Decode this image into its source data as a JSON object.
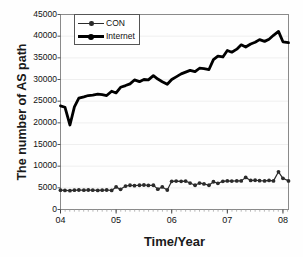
{
  "chart_data": {
    "type": "line",
    "title": "",
    "xlabel": "Time/Year",
    "ylabel": "The number of AS path",
    "ylim": [
      0,
      45000
    ],
    "ytick_labels": [
      "45000",
      "40000",
      "35000",
      "30000",
      "25000",
      "20000",
      "15000",
      "10000",
      "5000",
      "0"
    ],
    "ytick_values": [
      45000,
      40000,
      35000,
      30000,
      25000,
      20000,
      15000,
      10000,
      5000,
      0
    ],
    "xlim": [
      2004.0,
      2008.1
    ],
    "xtick_labels": [
      "04",
      "05",
      "06",
      "07",
      "08"
    ],
    "xtick_values": [
      2004,
      2005,
      2006,
      2007,
      2008
    ],
    "grid": "horizontal-faint",
    "legend_position": "top-left-inside",
    "minor_x_ticks": "monthly",
    "x": [
      2004.0,
      2004.08,
      2004.17,
      2004.25,
      2004.33,
      2004.42,
      2004.5,
      2004.58,
      2004.67,
      2004.75,
      2004.83,
      2004.92,
      2005.0,
      2005.08,
      2005.17,
      2005.25,
      2005.33,
      2005.42,
      2005.5,
      2005.58,
      2005.67,
      2005.75,
      2005.83,
      2005.92,
      2006.0,
      2006.08,
      2006.17,
      2006.25,
      2006.33,
      2006.42,
      2006.5,
      2006.58,
      2006.67,
      2006.75,
      2006.83,
      2006.92,
      2007.0,
      2007.08,
      2007.17,
      2007.25,
      2007.33,
      2007.42,
      2007.5,
      2007.58,
      2007.67,
      2007.75,
      2007.83,
      2007.92,
      2008.0,
      2008.1
    ],
    "series": [
      {
        "name": "Internet",
        "style": "thick-solid-black",
        "color": "#000000",
        "values": [
          23900,
          23600,
          19500,
          23700,
          25700,
          26000,
          26300,
          26400,
          26600,
          26500,
          26300,
          27300,
          26900,
          28200,
          28600,
          29000,
          29900,
          29500,
          30000,
          29900,
          30900,
          30100,
          29500,
          28900,
          30000,
          30600,
          31300,
          31700,
          32100,
          31800,
          32600,
          32500,
          32300,
          34600,
          35400,
          35200,
          36700,
          36300,
          37000,
          38000,
          37500,
          38200,
          38600,
          39200,
          38800,
          39300,
          40200,
          41100,
          38700,
          38500
        ]
      },
      {
        "name": "CON",
        "style": "thin-solid-with-round-markers",
        "color": "#2b2b2b",
        "values": [
          4450,
          4400,
          4350,
          4450,
          4500,
          4450,
          4500,
          4450,
          4400,
          4450,
          4500,
          4400,
          5200,
          4650,
          5400,
          5600,
          5500,
          5600,
          5650,
          5550,
          5600,
          4700,
          5200,
          4500,
          6500,
          6550,
          6500,
          6550,
          6100,
          5600,
          6100,
          5900,
          5600,
          6400,
          6050,
          6500,
          6600,
          6550,
          6600,
          6600,
          7400,
          6700,
          6750,
          6650,
          6600,
          6700,
          6600,
          8700,
          7200,
          6600
        ]
      }
    ]
  },
  "axis": {
    "ylabel_text": "The number of AS path",
    "xlabel_text": "Time/Year"
  },
  "legend": {
    "items": [
      {
        "label": "CON"
      },
      {
        "label": "Internet"
      }
    ]
  }
}
